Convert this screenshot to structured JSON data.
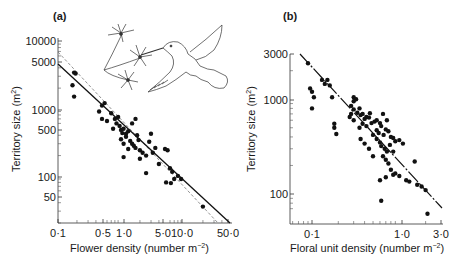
{
  "chart_data": [
    {
      "type": "scatter",
      "panel_label": "(a)",
      "title": "",
      "xlabel": "Flower density (number m⁻²)",
      "ylabel": "Territory size (m²)",
      "x_scale": "log",
      "y_scale": "log",
      "xlim": [
        0.1,
        50.0
      ],
      "ylim": [
        20,
        10000
      ],
      "x_ticks": [
        "0·1",
        "0·5",
        "1·0",
        "5·0",
        "10·0",
        "50·0"
      ],
      "y_ticks": [
        "10000",
        "5000",
        "1000",
        "500",
        "100",
        "50"
      ],
      "grid": false,
      "annotations": [
        "hummingbird feeding on flowers illustration"
      ],
      "lines": [
        {
          "name": "regression (solid)",
          "style": "solid",
          "points": [
            [
              0.1,
              4000
            ],
            [
              50.0,
              20
            ]
          ]
        },
        {
          "name": "regression (dashed)",
          "style": "dashed",
          "points": [
            [
              0.1,
              6000
            ],
            [
              40.0,
              20
            ]
          ]
        }
      ],
      "points": [
        [
          0.18,
          3400
        ],
        [
          0.19,
          3300
        ],
        [
          0.17,
          2200
        ],
        [
          0.18,
          1500
        ],
        [
          0.45,
          900
        ],
        [
          0.5,
          1100
        ],
        [
          0.55,
          1200
        ],
        [
          0.5,
          700
        ],
        [
          0.7,
          850
        ],
        [
          0.8,
          700
        ],
        [
          0.9,
          750
        ],
        [
          0.85,
          600
        ],
        [
          0.95,
          550
        ],
        [
          1.0,
          480
        ],
        [
          1.05,
          430
        ],
        [
          1.1,
          500
        ],
        [
          1.2,
          420
        ],
        [
          1.3,
          460
        ],
        [
          1.0,
          350
        ],
        [
          1.1,
          300
        ],
        [
          1.2,
          380
        ],
        [
          1.4,
          330
        ],
        [
          1.5,
          300
        ],
        [
          1.6,
          280
        ],
        [
          1.7,
          260
        ],
        [
          1.8,
          400
        ],
        [
          1.9,
          340
        ],
        [
          2.0,
          240
        ],
        [
          1.3,
          250
        ],
        [
          1.1,
          190
        ],
        [
          2.2,
          220
        ],
        [
          2.5,
          200
        ],
        [
          2.0,
          180
        ],
        [
          2.8,
          320
        ],
        [
          3.0,
          420
        ],
        [
          3.2,
          220
        ],
        [
          3.5,
          260
        ],
        [
          4.0,
          150
        ],
        [
          2.5,
          110
        ],
        [
          5.0,
          250
        ],
        [
          5.5,
          240
        ],
        [
          6.0,
          130
        ],
        [
          6.5,
          115
        ],
        [
          7.0,
          90
        ],
        [
          5.2,
          80
        ],
        [
          6.2,
          78
        ],
        [
          8.0,
          100
        ],
        [
          9.0,
          90
        ],
        [
          1.5,
          600
        ],
        [
          1.7,
          700
        ],
        [
          0.6,
          650
        ],
        [
          0.75,
          500
        ],
        [
          20.0,
          35
        ]
      ]
    },
    {
      "type": "scatter",
      "panel_label": "(b)",
      "title": "",
      "xlabel": "Floral unit density (number m⁻²)",
      "ylabel": "Territory size (m²)",
      "x_scale": "log",
      "y_scale": "log",
      "xlim": [
        0.07,
        3.0
      ],
      "ylim": [
        60,
        3000
      ],
      "x_ticks": [
        "0·1",
        "1·0",
        "3·0"
      ],
      "y_ticks": [
        "3000",
        "1000",
        "100"
      ],
      "grid": false,
      "lines": [
        {
          "name": "regression",
          "style": "dash-dot",
          "points": [
            [
              0.075,
              2900
            ],
            [
              3.0,
              70
            ]
          ]
        }
      ],
      "points": [
        [
          0.09,
          2400
        ],
        [
          0.1,
          1200
        ],
        [
          0.095,
          1300
        ],
        [
          0.105,
          1050
        ],
        [
          0.1,
          800
        ],
        [
          0.13,
          1600
        ],
        [
          0.14,
          1450
        ],
        [
          0.15,
          1600
        ],
        [
          0.16,
          1400
        ],
        [
          0.17,
          1050
        ],
        [
          0.18,
          550
        ],
        [
          0.18,
          500
        ],
        [
          0.19,
          430
        ],
        [
          0.28,
          850
        ],
        [
          0.3,
          1050
        ],
        [
          0.3,
          950
        ],
        [
          0.32,
          1000
        ],
        [
          0.28,
          700
        ],
        [
          0.27,
          650
        ],
        [
          0.3,
          600
        ],
        [
          0.33,
          720
        ],
        [
          0.35,
          800
        ],
        [
          0.36,
          680
        ],
        [
          0.38,
          700
        ],
        [
          0.4,
          620
        ],
        [
          0.42,
          650
        ],
        [
          0.45,
          640
        ],
        [
          0.35,
          500
        ],
        [
          0.38,
          550
        ],
        [
          0.42,
          520
        ],
        [
          0.48,
          560
        ],
        [
          0.52,
          580
        ],
        [
          0.55,
          600
        ],
        [
          0.6,
          560
        ],
        [
          0.62,
          520
        ],
        [
          0.65,
          700
        ],
        [
          0.7,
          480
        ],
        [
          0.75,
          460
        ],
        [
          0.36,
          380
        ],
        [
          0.4,
          340
        ],
        [
          0.45,
          300
        ],
        [
          0.5,
          420
        ],
        [
          0.55,
          380
        ],
        [
          0.6,
          350
        ],
        [
          0.62,
          320
        ],
        [
          0.68,
          300
        ],
        [
          0.72,
          280
        ],
        [
          0.8,
          400
        ],
        [
          0.85,
          390
        ],
        [
          0.9,
          360
        ],
        [
          1.0,
          370
        ],
        [
          1.1,
          340
        ],
        [
          0.65,
          250
        ],
        [
          0.7,
          230
        ],
        [
          0.75,
          210
        ],
        [
          0.8,
          180
        ],
        [
          0.85,
          160
        ],
        [
          0.9,
          165
        ],
        [
          1.0,
          155
        ],
        [
          1.2,
          140
        ],
        [
          1.3,
          135
        ],
        [
          1.5,
          220
        ],
        [
          1.6,
          125
        ],
        [
          1.8,
          120
        ],
        [
          2.0,
          110
        ],
        [
          0.6,
          140
        ],
        [
          0.7,
          150
        ],
        [
          0.62,
          85
        ],
        [
          2.1,
          62
        ],
        [
          0.5,
          250
        ],
        [
          0.55,
          470
        ],
        [
          0.58,
          440
        ],
        [
          0.66,
          420
        ],
        [
          0.78,
          330
        ],
        [
          0.72,
          600
        ],
        [
          0.3,
          780
        ],
        [
          0.85,
          280
        ],
        [
          0.46,
          710
        ]
      ]
    }
  ],
  "panel_a": {
    "label": "(a)",
    "y_title": "Territory size (m",
    "y_title_sup": "2",
    "y_title_end": ")",
    "x_title": "Flower density (number m",
    "x_title_sup": "−2",
    "x_title_end": ")",
    "y_ticks": [
      {
        "label": "10000",
        "y": 41
      },
      {
        "label": "5000",
        "y": 62
      },
      {
        "label": "1000",
        "y": 110
      },
      {
        "label": "500",
        "y": 130
      },
      {
        "label": "100",
        "y": 177
      },
      {
        "label": "50",
        "y": 197
      }
    ],
    "x_ticks": [
      {
        "label": "0·1",
        "x": 58
      },
      {
        "label": "0·5",
        "x": 103
      },
      {
        "label": "1·0",
        "x": 124
      },
      {
        "label": "5·0",
        "x": 163
      },
      {
        "label": "10·0",
        "x": 182
      },
      {
        "label": "50·0",
        "x": 228
      }
    ]
  },
  "panel_b": {
    "label": "(b)",
    "y_title": "Territory size (m",
    "y_title_sup": "2",
    "y_title_end": ")",
    "x_title": "Floral unit density (number m",
    "x_title_sup": "−2",
    "x_title_end": ")",
    "y_ticks": [
      {
        "label": "3000",
        "y": 54
      },
      {
        "label": "1000",
        "y": 100
      },
      {
        "label": "100",
        "y": 194
      }
    ],
    "x_ticks": [
      {
        "label": "0·1",
        "x": 312
      },
      {
        "label": "1·0",
        "x": 402
      },
      {
        "label": "3·0",
        "x": 441
      }
    ]
  }
}
